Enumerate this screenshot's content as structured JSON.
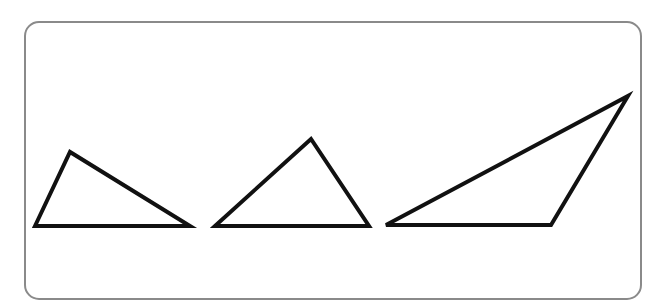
{
  "frame": {
    "x": 25,
    "y": 22,
    "width": 616,
    "height": 277,
    "radius": 14,
    "stroke": "#8a8a8a",
    "stroke_width": 2,
    "fill": "#ffffff"
  },
  "shape_style": {
    "stroke": "#111111",
    "stroke_width": 4,
    "fill": "#ffffff"
  },
  "triangles": [
    {
      "name": "triangle-1",
      "points": [
        [
          35,
          226
        ],
        [
          70,
          152
        ],
        [
          190,
          226
        ]
      ]
    },
    {
      "name": "triangle-2",
      "points": [
        [
          215,
          226
        ],
        [
          311,
          139
        ],
        [
          369,
          226
        ]
      ]
    },
    {
      "name": "triangle-3",
      "points": [
        [
          386,
          225
        ],
        [
          551,
          225
        ],
        [
          628,
          96
        ]
      ]
    }
  ]
}
